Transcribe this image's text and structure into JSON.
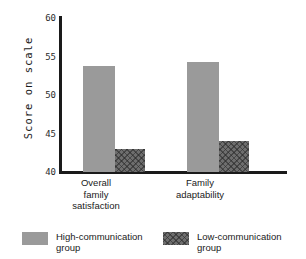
{
  "chart_data": {
    "type": "bar",
    "title": "",
    "xlabel": "",
    "ylabel": "Score on scale",
    "ylim": [
      40,
      60
    ],
    "ytick_values": [
      40,
      45,
      50,
      55,
      60
    ],
    "ytick_labels": [
      "40",
      "45",
      "50",
      "55",
      "60"
    ],
    "grid": false,
    "legend_position": "bottom",
    "categories": [
      "Overall family satisfaction",
      "Family adaptability"
    ],
    "category_lines": [
      [
        "Overall",
        "family",
        "satisfaction"
      ],
      [
        "Family",
        "adaptability"
      ]
    ],
    "series": [
      {
        "name": "High-communication group",
        "legend_lines": [
          "High-communication",
          "group"
        ],
        "color": "#9a9a9a",
        "pattern": "solid",
        "values": [
          53.8,
          54.3
        ]
      },
      {
        "name": "Low-communication group",
        "legend_lines": [
          "Low-communication",
          "group"
        ],
        "color": "#6e6e6e",
        "pattern": "crosshatch",
        "values": [
          43.0,
          44.0
        ]
      }
    ]
  },
  "colors": {
    "background": "#ffffff",
    "axis": "#1a1a1a",
    "text": "#1a1a1a",
    "high_communication": "#9a9a9a",
    "low_communication": "#6e6e6e"
  }
}
